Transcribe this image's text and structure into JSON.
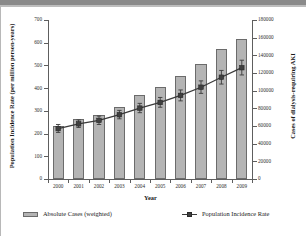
{
  "chart_data": {
    "type": "bar",
    "title": "",
    "xlabel": "Year",
    "ylabel": "Population Incidence Rate (per million person-years)",
    "y2label": "Cases of dialysis-requiring AKI",
    "categories": [
      "2000",
      "2001",
      "2002",
      "2003",
      "2004",
      "2005",
      "2006",
      "2007",
      "2008",
      "2009"
    ],
    "ylim": [
      0,
      700
    ],
    "yticks": [
      0,
      100,
      200,
      300,
      400,
      500,
      600,
      700
    ],
    "y2lim": [
      0,
      180000
    ],
    "y2ticks": [
      0,
      20000,
      40000,
      60000,
      80000,
      100000,
      120000,
      140000,
      160000,
      180000
    ],
    "grid": false,
    "legend_position": "bottom",
    "series": [
      {
        "name": "Absolute Cases (weighted)",
        "type": "bar",
        "axis": "right",
        "color": "#b4b4b4",
        "values": [
          60000,
          68000,
          73000,
          82000,
          95000,
          104000,
          117000,
          130000,
          147000,
          158000
        ]
      },
      {
        "name": "Population Incidence Rate",
        "type": "line",
        "axis": "left",
        "color": "#3a3a3a",
        "values": [
          222,
          243,
          258,
          283,
          312,
          337,
          368,
          404,
          448,
          490
        ],
        "error_low": [
          205,
          227,
          240,
          265,
          292,
          316,
          344,
          377,
          418,
          458
        ],
        "error_high": [
          240,
          260,
          277,
          302,
          333,
          359,
          392,
          432,
          478,
          523
        ]
      }
    ]
  },
  "axes": {
    "left_title": "Population Incidence Rate (per million person-years)",
    "right_title": "Cases of dialysis-requiring AKI",
    "x_title": "Year",
    "left_tick_labels": [
      "700",
      "600",
      "500",
      "400",
      "300",
      "200",
      "100",
      "0"
    ],
    "right_tick_labels": [
      "180000",
      "160000",
      "140000",
      "120000",
      "100000",
      "80000",
      "60000",
      "40000",
      "20000",
      "0"
    ],
    "x_tick_labels": [
      "2000",
      "2001",
      "2002",
      "2003",
      "2004",
      "2005",
      "2006",
      "2007",
      "2008",
      "2009"
    ]
  },
  "legend": {
    "bars_label": "Absolute Cases (weighted)",
    "line_label": "Population Incidence Rate"
  },
  "colors": {
    "bar_fill": "#b4b4b4",
    "bar_edge": "#6b6b6b",
    "line": "#3a3a3a",
    "axis": "#5e5e5e",
    "text": "#1a1a1a",
    "header_band": "#8a8a8a"
  }
}
